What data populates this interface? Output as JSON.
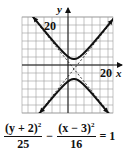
{
  "chart_data": {
    "type": "line",
    "title": "",
    "equation": {
      "term1_numerator": "(y + 2)",
      "term1_exponent": "2",
      "term1_denominator": "25",
      "operator": "−",
      "term2_numerator": "(x − 3)",
      "term2_exponent": "2",
      "term2_denominator": "16",
      "rhs": "= 1"
    },
    "xlabel": "x",
    "ylabel": "y",
    "x_tick_label": "20",
    "y_tick_label": "20",
    "xlim": [
      -24,
      24
    ],
    "ylim": [
      -24,
      24
    ],
    "grid": true,
    "grid_step": 4,
    "curve": {
      "kind": "hyperbola",
      "orientation": "vertical",
      "center": [
        3,
        -2
      ],
      "a": 5,
      "b": 4,
      "vertices": [
        [
          3,
          3
        ],
        [
          3,
          -7
        ]
      ]
    },
    "asymptotes": [
      {
        "equation": "y + 2 = (5/4)(x - 3)",
        "style": "dashed"
      },
      {
        "equation": "y + 2 = -(5/4)(x - 3)",
        "style": "dashed"
      }
    ],
    "colors": {
      "curve": "#111111",
      "grid": "#9a9a9a",
      "axis": "#111111"
    }
  }
}
